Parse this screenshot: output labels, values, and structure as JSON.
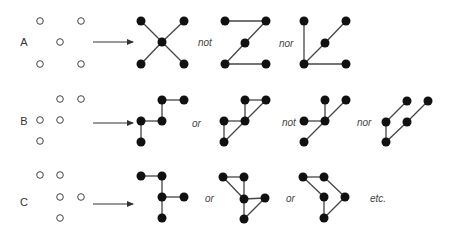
{
  "rows": [
    {
      "label": "A",
      "label_pos": [
        24,
        46
      ],
      "open_points": [
        [
          40,
          21
        ],
        [
          81,
          21
        ],
        [
          60,
          42
        ],
        [
          40,
          64
        ],
        [
          81,
          64
        ]
      ],
      "arrow": {
        "x1": 93,
        "x2": 133,
        "y": 42
      },
      "graphs": [
        {
          "nodes": [
            [
              141,
              21
            ],
            [
              184,
              21
            ],
            [
              162,
              42
            ],
            [
              141,
              64
            ],
            [
              184,
              64
            ]
          ],
          "edges": [
            [
              0,
              2
            ],
            [
              1,
              2
            ],
            [
              2,
              3
            ],
            [
              2,
              4
            ]
          ]
        },
        {
          "nodes": [
            [
              225,
              21
            ],
            [
              266,
              21
            ],
            [
              245,
              43
            ],
            [
              225,
              64
            ],
            [
              266,
              64
            ]
          ],
          "edges": [
            [
              0,
              1
            ],
            [
              1,
              2
            ],
            [
              2,
              3
            ],
            [
              3,
              4
            ]
          ]
        },
        {
          "nodes": [
            [
              304,
              21
            ],
            [
              346,
              21
            ],
            [
              325,
              43
            ],
            [
              304,
              64
            ],
            [
              346,
              64
            ]
          ],
          "edges": [
            [
              0,
              3
            ],
            [
              3,
              2
            ],
            [
              2,
              1
            ],
            [
              3,
              4
            ]
          ]
        }
      ],
      "connectors": [
        {
          "text": "not",
          "x": 198,
          "y": 46
        },
        {
          "text": "nor",
          "x": 279,
          "y": 47
        }
      ]
    },
    {
      "label": "B",
      "label_pos": [
        24,
        125
      ],
      "open_points": [
        [
          60,
          99
        ],
        [
          81,
          99
        ],
        [
          40,
          120
        ],
        [
          60,
          120
        ],
        [
          40,
          141
        ]
      ],
      "arrow": {
        "x1": 93,
        "x2": 133,
        "y": 123
      },
      "graphs": [
        {
          "nodes": [
            [
              162,
              100
            ],
            [
              184,
              100
            ],
            [
              141,
              121
            ],
            [
              162,
              121
            ],
            [
              141,
              142
            ]
          ],
          "edges": [
            [
              0,
              1
            ],
            [
              0,
              3
            ],
            [
              2,
              3
            ],
            [
              2,
              4
            ]
          ]
        },
        {
          "nodes": [
            [
              245,
              100
            ],
            [
              266,
              100
            ],
            [
              224,
              121
            ],
            [
              245,
              121
            ],
            [
              224,
              142
            ]
          ],
          "edges": [
            [
              0,
              1
            ],
            [
              0,
              3
            ],
            [
              1,
              3
            ],
            [
              3,
              4
            ],
            [
              2,
              3
            ],
            [
              2,
              4
            ]
          ]
        },
        {
          "nodes": [
            [
              325,
              100
            ],
            [
              346,
              100
            ],
            [
              304,
              121
            ],
            [
              325,
              121
            ],
            [
              304,
              142
            ]
          ],
          "edges": [
            [
              0,
              3
            ],
            [
              1,
              3
            ],
            [
              3,
              4
            ],
            [
              2,
              3
            ]
          ]
        },
        {
          "nodes": [
            [
              407,
              101
            ],
            [
              428,
              101
            ],
            [
              386,
              122
            ],
            [
              407,
              122
            ],
            [
              386,
              142
            ]
          ],
          "edges": [
            [
              0,
              2
            ],
            [
              1,
              3
            ],
            [
              3,
              4
            ],
            [
              2,
              4
            ]
          ]
        }
      ],
      "connectors": [
        {
          "text": "or",
          "x": 192,
          "y": 127
        },
        {
          "text": "not",
          "x": 282,
          "y": 126
        },
        {
          "text": "nor",
          "x": 357,
          "y": 126
        }
      ]
    },
    {
      "label": "C",
      "label_pos": [
        24,
        206
      ],
      "open_points": [
        [
          40,
          175
        ],
        [
          60,
          175
        ],
        [
          60,
          197
        ],
        [
          81,
          197
        ],
        [
          60,
          218
        ]
      ],
      "arrow": {
        "x1": 93,
        "x2": 133,
        "y": 204
      },
      "graphs": [
        {
          "nodes": [
            [
              141,
              176
            ],
            [
              162,
              176
            ],
            [
              162,
              197
            ],
            [
              184,
              197
            ],
            [
              162,
              218
            ]
          ],
          "edges": [
            [
              0,
              1
            ],
            [
              1,
              2
            ],
            [
              2,
              4
            ],
            [
              2,
              3
            ]
          ]
        },
        {
          "nodes": [
            [
              223,
              177
            ],
            [
              244,
              177
            ],
            [
              244,
              199
            ],
            [
              265,
              198
            ],
            [
              244,
              219
            ]
          ],
          "edges": [
            [
              0,
              1
            ],
            [
              0,
              2
            ],
            [
              1,
              2
            ],
            [
              2,
              4
            ],
            [
              2,
              3
            ],
            [
              3,
              4
            ]
          ]
        },
        {
          "nodes": [
            [
              303,
              177
            ],
            [
              324,
              177
            ],
            [
              324,
              197
            ],
            [
              345,
              197
            ],
            [
              324,
              218
            ]
          ],
          "edges": [
            [
              0,
              1
            ],
            [
              0,
              2
            ],
            [
              1,
              3
            ],
            [
              2,
              4
            ],
            [
              3,
              4
            ]
          ]
        }
      ],
      "connectors": [
        {
          "text": "or",
          "x": 205,
          "y": 202
        },
        {
          "text": "or",
          "x": 286,
          "y": 202
        },
        {
          "text": "etc.",
          "x": 370,
          "y": 202
        }
      ]
    }
  ],
  "style": {
    "node_color": "#111111",
    "edge_color": "#444444",
    "open_node_stroke": "#444444",
    "text_color": "#333333",
    "node_radius": 4.5,
    "open_radius": 3.3
  }
}
